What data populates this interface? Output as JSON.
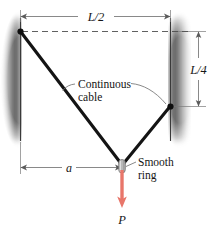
{
  "figure": {
    "background_color": "#ffffff",
    "width": 220,
    "height": 228
  },
  "colors": {
    "cable": "#1a1a1a",
    "wall": "#4a4a4a",
    "dimension_line": "#6b6b6b",
    "leader_line": "#6b6b6b",
    "load_arrow": "#e8766a",
    "ring_body": "#b8b8b8",
    "ring_outline": "#777777",
    "anchor_dot": "#111111",
    "text": "#1a1a1a",
    "dashed_line": "#555555"
  },
  "dimensions": {
    "span_top": {
      "label": "L/2",
      "orientation": "horizontal",
      "x_start": 20,
      "x_end": 170,
      "y": 16
    },
    "drop_right": {
      "label": "L/4",
      "orientation": "vertical",
      "y_start": 31,
      "y_end": 106,
      "x": 198
    },
    "offset_bottom": {
      "label": "a",
      "orientation": "horizontal",
      "x_start": 20,
      "x_end": 122,
      "y": 167
    }
  },
  "annotations": {
    "cable_note": {
      "line1": "Continuous",
      "line2": "cable",
      "x": 78,
      "y": 85
    },
    "ring_note": {
      "line1": "Smooth",
      "line2": "ring",
      "x": 137,
      "y": 167
    }
  },
  "load": {
    "label": "P",
    "direction": "down",
    "x": 122,
    "y_start": 172,
    "y_end": 207,
    "color": "#e8766a"
  },
  "geometry": {
    "left_wall": {
      "x": 20,
      "y_top": 18,
      "y_bottom": 141,
      "side": "left"
    },
    "right_wall": {
      "x": 170,
      "y_top": 18,
      "y_bottom": 141,
      "side": "right"
    },
    "anchor_left": {
      "x": 20,
      "y": 31
    },
    "anchor_right": {
      "x": 170,
      "y": 106
    },
    "ring": {
      "x": 122,
      "y": 166
    },
    "dashed_reference": {
      "x_start": 22,
      "y": 31,
      "x_end": 190
    }
  },
  "icons": {
    "arrow": "arrowhead",
    "ring": "smooth-ring-glyph"
  }
}
